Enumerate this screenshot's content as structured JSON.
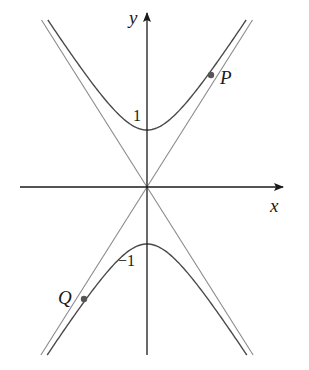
{
  "figure": {
    "width": 309,
    "height": 370,
    "origin_px": [
      147,
      187
    ],
    "colors": {
      "axis": "#1a1a1a",
      "curve": "#4a4a4a",
      "asymptote": "#8a8a8a",
      "point": "#555555",
      "text": "#1a1a1a"
    },
    "axes": {
      "x": {
        "label": "x",
        "from_px": 20,
        "to_px": 283
      },
      "y": {
        "label": "y",
        "from_px": 355,
        "to_px": 13
      }
    },
    "hyperbola": {
      "equation": "y^2 - x^2/b^2 = 1 (vertical hyperbola, two branches)",
      "a_px": 57,
      "b_px": 36,
      "y_top_px": 20,
      "y_bottom_px": 355
    },
    "asymptotes": {
      "slope_px": 1.583,
      "y_top_px": 20,
      "y_bottom_px": 355
    },
    "tick_labels": [
      {
        "text": "1",
        "x": 133,
        "y": 108,
        "size": 16
      },
      {
        "text": "−1",
        "x": 118,
        "y": 253,
        "size": 16
      }
    ],
    "points": [
      {
        "name": "P",
        "x": 211,
        "y": 75,
        "label_x": 220,
        "label_y": 68
      },
      {
        "name": "Q",
        "x": 84,
        "y": 299,
        "label_x": 58,
        "label_y": 288
      }
    ],
    "axis_labels": {
      "y": {
        "text": "y",
        "x": 129,
        "y": 8
      },
      "x": {
        "text": "x",
        "x": 270,
        "y": 196
      }
    }
  }
}
